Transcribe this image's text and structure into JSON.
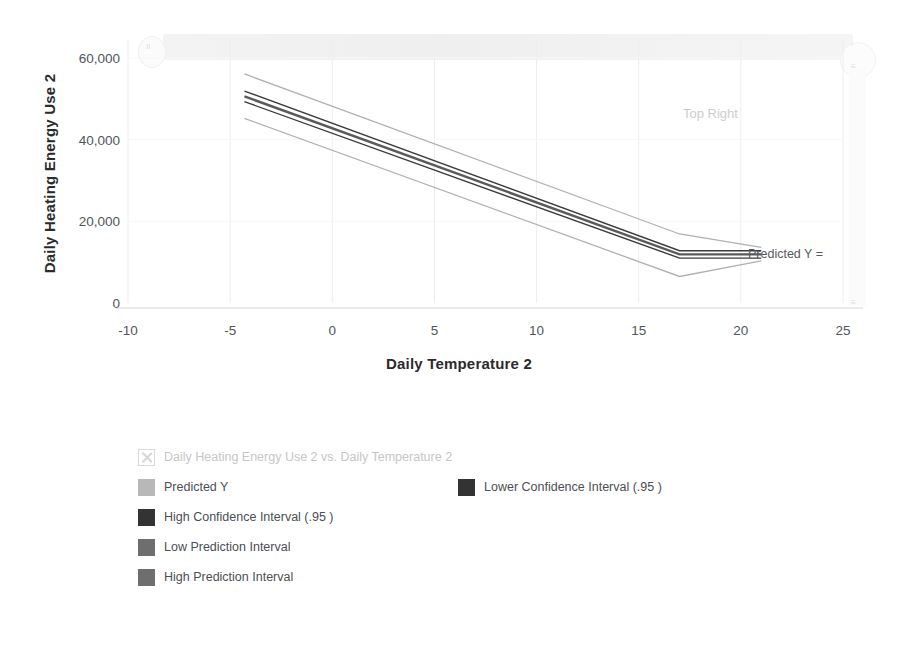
{
  "chart_data": {
    "type": "line",
    "title": "Daily Heating Energy Use 2 vs. Daily Temperature 2",
    "xlabel": "Daily Temperature 2",
    "ylabel": "Daily Heating Energy Use 2",
    "xlim": [
      -10,
      25
    ],
    "ylim": [
      0,
      60000
    ],
    "xticks": [
      "-10",
      "-5",
      "0",
      "5",
      "10",
      "15",
      "20",
      "25"
    ],
    "xtick_values": [
      -10,
      -5,
      0,
      5,
      10,
      15,
      20,
      25
    ],
    "yticks": [
      "0",
      "20,000",
      "40,000",
      "60,000"
    ],
    "ytick_values": [
      0,
      20000,
      40000,
      60000
    ],
    "grid": true,
    "legend_position": "bottom",
    "annotations": [
      {
        "name": "top-right-note",
        "text": "Top Right",
        "x": 15.6,
        "y": 49000
      },
      {
        "name": "predicted-y-note",
        "text": "Predicted Y =",
        "x": 21.2,
        "y": 12200
      }
    ],
    "series": [
      {
        "name": "Predicted Y",
        "color": "#5a5a5a",
        "width": 2.4,
        "x": [
          -4.3,
          17.0,
          21.0
        ],
        "values": [
          50600,
          11900,
          11900
        ]
      },
      {
        "name": "Lower Confidence Interval (.95 )",
        "color": "#3a3a3a",
        "width": 1.4,
        "x": [
          -4.3,
          17.0,
          21.0
        ],
        "values": [
          49300,
          11000,
          11000
        ]
      },
      {
        "name": "High Confidence Interval (.95 )",
        "color": "#3a3a3a",
        "width": 1.4,
        "x": [
          -4.3,
          17.0,
          21.0
        ],
        "values": [
          51900,
          12800,
          12800
        ]
      },
      {
        "name": "Low Prediction Interval",
        "color": "#b0b0b0",
        "width": 1.3,
        "x": [
          -4.3,
          17.0,
          21.0
        ],
        "values": [
          45200,
          6500,
          10300
        ]
      },
      {
        "name": "High Prediction Interval",
        "color": "#b0b0b0",
        "width": 1.3,
        "x": [
          -4.3,
          17.0,
          21.0
        ],
        "values": [
          56100,
          16900,
          13600
        ]
      }
    ]
  },
  "axes": {
    "y_title": "Daily Heating Energy Use 2",
    "x_title": "Daily Temperature 2",
    "y_ticks": [
      "60,000",
      "40,000",
      "20,000",
      "0"
    ],
    "x_ticks": [
      "-10",
      "-5",
      "0",
      "5",
      "10",
      "15",
      "20",
      "25"
    ]
  },
  "annotations": {
    "top_right": "Top Right",
    "predicted_y": "Predicted Y ="
  },
  "legend": {
    "title": "Daily Heating Energy Use 2 vs. Daily Temperature 2",
    "title_marker_icon": "x-marker-icon",
    "rows": [
      [
        {
          "label": "Predicted Y",
          "color": "#b8b8b8"
        },
        {
          "label": "Lower Confidence Interval (.95 )",
          "color": "#333333"
        }
      ],
      [
        {
          "label": "High Confidence Interval (.95 )",
          "color": "#333333"
        }
      ],
      [
        {
          "label": "Low Prediction Interval",
          "color": "#6e6e6e"
        }
      ],
      [
        {
          "label": "High Prediction Interval",
          "color": "#6e6e6e"
        }
      ]
    ]
  },
  "artifacts": {
    "glyph_left": "II",
    "glyph_top": "▫",
    "glyph_mid": "≡",
    "glyph_bottom": "≡"
  }
}
